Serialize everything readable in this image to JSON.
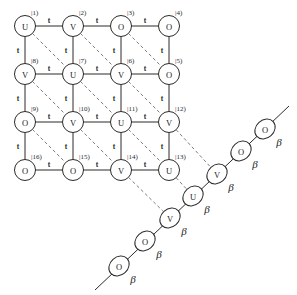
{
  "figure": {
    "type": "lattice-graph",
    "grid": {
      "rows": 4,
      "cols": 4,
      "cell_w": 48,
      "cell_h": 48,
      "origin_x": 25,
      "origin_y": 26,
      "node_radius": 10.5,
      "nodes": [
        {
          "id": 1,
          "symbol": "U",
          "index": "|1)",
          "row": 0,
          "col": 0
        },
        {
          "id": 2,
          "symbol": "V",
          "index": "|2)",
          "row": 0,
          "col": 1
        },
        {
          "id": 3,
          "symbol": "O",
          "index": "|3)",
          "row": 0,
          "col": 2
        },
        {
          "id": 4,
          "symbol": "O",
          "index": "|4)",
          "row": 0,
          "col": 3
        },
        {
          "id": 8,
          "symbol": "V",
          "index": "|8)",
          "row": 1,
          "col": 0
        },
        {
          "id": 7,
          "symbol": "U",
          "index": "|7)",
          "row": 1,
          "col": 1
        },
        {
          "id": 6,
          "symbol": "V",
          "index": "|6)",
          "row": 1,
          "col": 2
        },
        {
          "id": 5,
          "symbol": "O",
          "index": "|5)",
          "row": 1,
          "col": 3
        },
        {
          "id": 9,
          "symbol": "O",
          "index": "|9)",
          "row": 2,
          "col": 0
        },
        {
          "id": 10,
          "symbol": "V",
          "index": "|10)",
          "row": 2,
          "col": 1
        },
        {
          "id": 11,
          "symbol": "U",
          "index": "|11)",
          "row": 2,
          "col": 2
        },
        {
          "id": 12,
          "symbol": "V",
          "index": "|12)",
          "row": 2,
          "col": 3
        },
        {
          "id": 16,
          "symbol": "O",
          "index": "|16)",
          "row": 3,
          "col": 0
        },
        {
          "id": 15,
          "symbol": "O",
          "index": "|15)",
          "row": 3,
          "col": 1
        },
        {
          "id": 14,
          "symbol": "V",
          "index": "|14)",
          "row": 3,
          "col": 2
        },
        {
          "id": 13,
          "symbol": "U",
          "index": "|13)",
          "row": 3,
          "col": 3
        }
      ]
    },
    "bond_label_t": "t",
    "bond_label_beta": "β",
    "horizontal_bonds": [
      {
        "from": 1,
        "to": 2,
        "label": "t"
      },
      {
        "from": 2,
        "to": 3,
        "label": "t"
      },
      {
        "from": 3,
        "to": 4,
        "label": "t"
      },
      {
        "from": 8,
        "to": 7,
        "label": "t"
      },
      {
        "from": 7,
        "to": 6,
        "label": "t"
      },
      {
        "from": 6,
        "to": 5,
        "label": "t"
      },
      {
        "from": 9,
        "to": 10,
        "label": "t"
      },
      {
        "from": 10,
        "to": 11,
        "label": "t"
      },
      {
        "from": 11,
        "to": 12,
        "label": "t"
      },
      {
        "from": 16,
        "to": 15,
        "label": "t"
      },
      {
        "from": 15,
        "to": 14,
        "label": "t"
      },
      {
        "from": 14,
        "to": 13,
        "label": "t"
      }
    ],
    "vertical_bonds": [
      {
        "from": 1,
        "to": 8,
        "label": "t"
      },
      {
        "from": 2,
        "to": 7,
        "label": "t"
      },
      {
        "from": 3,
        "to": 6,
        "label": "t"
      },
      {
        "from": 4,
        "to": 5,
        "label": "t"
      },
      {
        "from": 8,
        "to": 9,
        "label": "t"
      },
      {
        "from": 7,
        "to": 10,
        "label": "t"
      },
      {
        "from": 6,
        "to": 11,
        "label": "t"
      },
      {
        "from": 5,
        "to": 12,
        "label": "t"
      },
      {
        "from": 9,
        "to": 16,
        "label": "t"
      },
      {
        "from": 10,
        "to": 15,
        "label": "t"
      },
      {
        "from": 11,
        "to": 14,
        "label": "t"
      },
      {
        "from": 12,
        "to": 13,
        "label": "t"
      }
    ],
    "diagonal_dashed_bonds": [
      {
        "from": 1,
        "to": 7
      },
      {
        "from": 7,
        "to": 11
      },
      {
        "from": 11,
        "to": 13
      },
      {
        "from": 2,
        "to": 6
      },
      {
        "from": 6,
        "to": 12
      },
      {
        "from": 8,
        "to": 10
      },
      {
        "from": 10,
        "to": 14
      },
      {
        "from": 9,
        "to": 15
      },
      {
        "from": 3,
        "to": 5
      }
    ],
    "chain": {
      "orientation": "diagonal-lower-left-to-upper-right",
      "nodes": [
        {
          "pos": 0,
          "symbol": "O",
          "label": "β",
          "x": 119,
          "y": 266
        },
        {
          "pos": 1,
          "symbol": "O",
          "label": "β",
          "x": 145,
          "y": 241
        },
        {
          "pos": 2,
          "symbol": "V",
          "label": "β",
          "x": 170,
          "y": 218
        },
        {
          "pos": 3,
          "symbol": "U",
          "label": "β",
          "x": 193,
          "y": 196
        },
        {
          "pos": 4,
          "symbol": "V",
          "label": "β",
          "x": 217,
          "y": 174
        },
        {
          "pos": 5,
          "symbol": "O",
          "label": "β",
          "x": 241,
          "y": 151
        },
        {
          "pos": 6,
          "symbol": "O",
          "label": "β",
          "x": 265,
          "y": 129
        }
      ],
      "tail_start": {
        "x": 95,
        "y": 290
      },
      "tail_end": {
        "x": 289,
        "y": 106
      },
      "links_to_lattice": [
        {
          "lattice_node": 12,
          "chain_pos": 4
        },
        {
          "lattice_node": 13,
          "chain_pos": 3
        },
        {
          "lattice_node": 14,
          "chain_pos": 2
        }
      ]
    }
  }
}
